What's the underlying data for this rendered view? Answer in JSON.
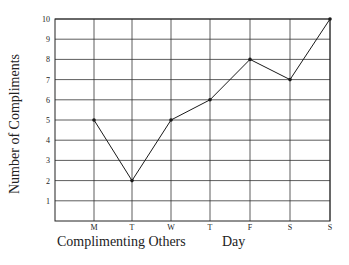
{
  "chart_data": {
    "type": "line",
    "title": "",
    "categories": [
      "M",
      "T",
      "W",
      "T",
      "F",
      "S",
      "S"
    ],
    "series": [
      {
        "name": "Number of Compliments",
        "values": [
          5,
          2,
          5,
          6,
          8,
          7,
          10
        ]
      }
    ],
    "xlabel_left": "Complimenting Others",
    "xlabel_right": "Day",
    "ylabel": "Number of Compliments",
    "yticks": [
      "1",
      "2",
      "3",
      "4",
      "5",
      "6",
      "7",
      "8",
      "9",
      "10"
    ],
    "ylim": [
      0,
      10
    ],
    "grid": true,
    "legend": "none"
  },
  "colors": {
    "line": "#1a1a1a",
    "grid": "#333333",
    "background": "#ffffff"
  }
}
